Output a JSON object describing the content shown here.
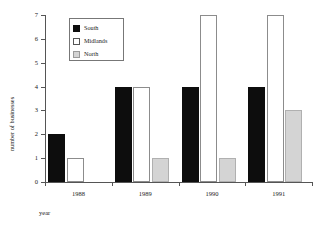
{
  "chart_data": {
    "type": "bar",
    "title": "",
    "subtitle": "",
    "xlabel": "year",
    "ylabel": "number of businesses",
    "categories": [
      "1988",
      "1989",
      "1990",
      "1991"
    ],
    "series": [
      {
        "name": "South",
        "color": "#0d0d0d",
        "values": [
          2,
          4,
          4,
          4
        ]
      },
      {
        "name": "Midlands",
        "color": "#ffffff",
        "values": [
          1,
          4,
          7,
          7
        ]
      },
      {
        "name": "North",
        "color": "#d4d4d4",
        "values": [
          0,
          1,
          1,
          3
        ]
      }
    ],
    "ylim": [
      0,
      7
    ],
    "yticks": [
      0,
      1,
      2,
      3,
      4,
      5,
      6,
      7
    ],
    "ytick_labels": [
      "0",
      "1",
      "2",
      "3",
      "4",
      "5",
      "6",
      "7"
    ],
    "grid": false,
    "legend_position": "top-left"
  },
  "legend": {
    "entries": [
      {
        "label": "South",
        "swatch": "filled-black-square-icon"
      },
      {
        "label": "Midlands",
        "swatch": "outlined-white-square-icon"
      },
      {
        "label": "North",
        "swatch": "filled-gray-square-icon"
      }
    ]
  },
  "axes": {
    "x_title": "year",
    "y_title": "number of businesses"
  }
}
